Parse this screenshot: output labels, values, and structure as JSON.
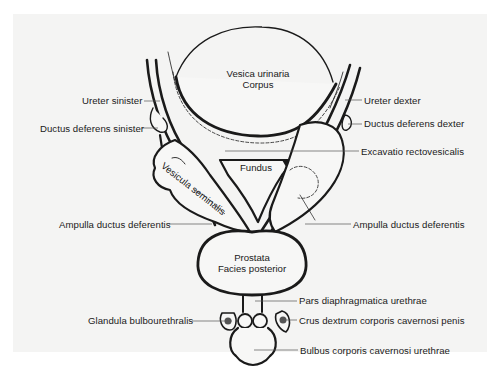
{
  "figure": {
    "background": "#ffffff",
    "panel_color": "#f4f4f3",
    "ink_color": "#1a1a1a",
    "leader_color": "#555555"
  },
  "organs": {
    "bladder": {
      "line1": "Vesica urinaria",
      "line2": "Corpus"
    },
    "fundus": "Fundus",
    "seminal_vesicle": "Vesicula seminalis",
    "prostate": {
      "line1": "Prostata",
      "line2": "Facies posterior"
    }
  },
  "labels_left": [
    {
      "id": "ureter-sinister",
      "text": "Ureter sinister",
      "x": 82,
      "y": 95,
      "line": [
        144,
        101,
        160,
        101
      ]
    },
    {
      "id": "ductus-deferens-sinister",
      "text": "Ductus deferens sinister",
      "x": 40,
      "y": 123,
      "line": [
        142,
        128,
        158,
        128
      ]
    },
    {
      "id": "ampulla-ductus-deferentis-left",
      "text": "Ampulla ductus deferentis",
      "x": 59,
      "y": 219,
      "line": [
        169,
        224,
        212,
        224
      ]
    },
    {
      "id": "glandula-bulbourethralis",
      "text": "Glandula bulbourethralis",
      "x": 88,
      "y": 315,
      "line": [
        192,
        321,
        232,
        321
      ]
    }
  ],
  "labels_right": [
    {
      "id": "ureter-dexter",
      "text": "Ureter dexter",
      "x": 364,
      "y": 95,
      "line": [
        345,
        100,
        362,
        100
      ]
    },
    {
      "id": "ductus-deferens-dexter",
      "text": "Ductus deferens dexter",
      "x": 364,
      "y": 118,
      "line": [
        348,
        124,
        362,
        124
      ]
    },
    {
      "id": "excavatio-rectovesicalis",
      "text": "Excavatio rectovesicalis",
      "x": 361,
      "y": 146,
      "line": [
        225,
        151,
        359,
        151
      ]
    },
    {
      "id": "ampulla-ductus-deferentis-right",
      "text": "Ampulla ductus deferentis",
      "x": 353,
      "y": 219,
      "line": [
        305,
        224,
        351,
        224
      ]
    },
    {
      "id": "pars-diaphragmatica-urethrae",
      "text": "Pars diaphragmatica urethrae",
      "x": 299,
      "y": 295,
      "line": [
        255,
        301,
        297,
        301
      ]
    },
    {
      "id": "crus-dextrum",
      "text": "Crus dextrum corporis cavernosi penis",
      "x": 299,
      "y": 315,
      "line": [
        286,
        320,
        297,
        320
      ]
    },
    {
      "id": "bulbus-corporis",
      "text": "Bulbus corporis cavernosi urethrae",
      "x": 300,
      "y": 345,
      "line": [
        254,
        350,
        298,
        350
      ]
    }
  ]
}
